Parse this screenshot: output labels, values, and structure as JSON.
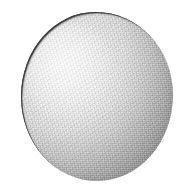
{
  "figure": {
    "width": 185,
    "height": 189,
    "background_color": "#ffffff",
    "caption": "",
    "alt_text": "Grayscale photograph of a single rounded sphere-shaped object on a plain white background"
  },
  "subject": {
    "name": "sphere-object",
    "shape": "sphere",
    "center_x": 96,
    "center_y": 97,
    "radius": 76,
    "bounds": {
      "left": 21,
      "top": 12,
      "right": 173,
      "bottom": 181
    },
    "surface": "matte granular",
    "texture": "fine scan grain",
    "silhouette": "slightly irregular faceted circle"
  },
  "lighting": {
    "direction": "upper-left",
    "highlight_x": 68,
    "highlight_y": 72,
    "highlight_color": "#f4f4f4",
    "midtone_color": "#c4c4c4",
    "shadow_color": "#808080",
    "terminator_region": "lower-right",
    "rim_outline_color": "#3c3c3c",
    "rim_outline_arc": "upper-left"
  },
  "palette": {
    "background": "#ffffff",
    "lightest": "#f4f4f4",
    "light": "#e0e0e0",
    "mid": "#c0c0c0",
    "dark": "#989898",
    "darkest": "#7e7e7e",
    "outline": "#3c3c3c"
  }
}
